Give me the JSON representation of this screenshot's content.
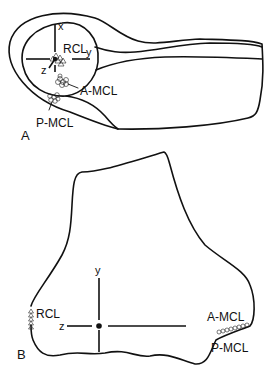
{
  "figure": {
    "panel_a": {
      "label": "A",
      "axes": {
        "x": "x",
        "y": "y",
        "z": "z"
      },
      "ligament_labels": {
        "rcl": "RCL",
        "a_mcl": "A-MCL",
        "p_mcl": "P-MCL"
      }
    },
    "panel_b": {
      "label": "B",
      "axes": {
        "y": "y",
        "z": "z"
      },
      "ligament_labels": {
        "rcl": "RCL",
        "a_mcl": "A-MCL",
        "p_mcl": "P-MCL"
      }
    }
  }
}
